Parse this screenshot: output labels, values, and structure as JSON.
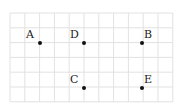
{
  "diagram": {
    "type": "grid-points",
    "grid": {
      "x0": 10,
      "y0": 13,
      "cell": 14.8,
      "cols": 11,
      "rows": 6,
      "line_color": "#e2e2e2"
    },
    "points": [
      {
        "label": "A",
        "x": 40,
        "y": 43,
        "label_dx": -14,
        "label_dy": -14
      },
      {
        "label": "D",
        "x": 84,
        "y": 43,
        "label_dx": -14,
        "label_dy": -14
      },
      {
        "label": "B",
        "x": 142,
        "y": 43,
        "label_dx": 2,
        "label_dy": -14
      },
      {
        "label": "C",
        "x": 84,
        "y": 88,
        "label_dx": -14,
        "label_dy": -14
      },
      {
        "label": "E",
        "x": 142,
        "y": 88,
        "label_dx": 2,
        "label_dy": -14
      }
    ],
    "point_color": "#111111"
  }
}
